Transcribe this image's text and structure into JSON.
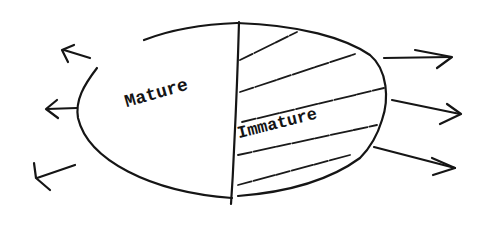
{
  "diagram": {
    "type": "ellipse-split",
    "regions": [
      {
        "id": "left",
        "label": "Mature",
        "fill": "none",
        "arrows": {
          "direction": "outward-left",
          "count": 3
        }
      },
      {
        "id": "right",
        "label": "Immature",
        "fill": "hatched",
        "arrows": {
          "direction": "outward-right",
          "count": 3
        }
      }
    ],
    "divider": "vertical line",
    "style": "hand-drawn",
    "ink_color": "#151515",
    "background": "#ffffff"
  },
  "labels": {
    "mature": "Mature",
    "immature": "Immature"
  }
}
